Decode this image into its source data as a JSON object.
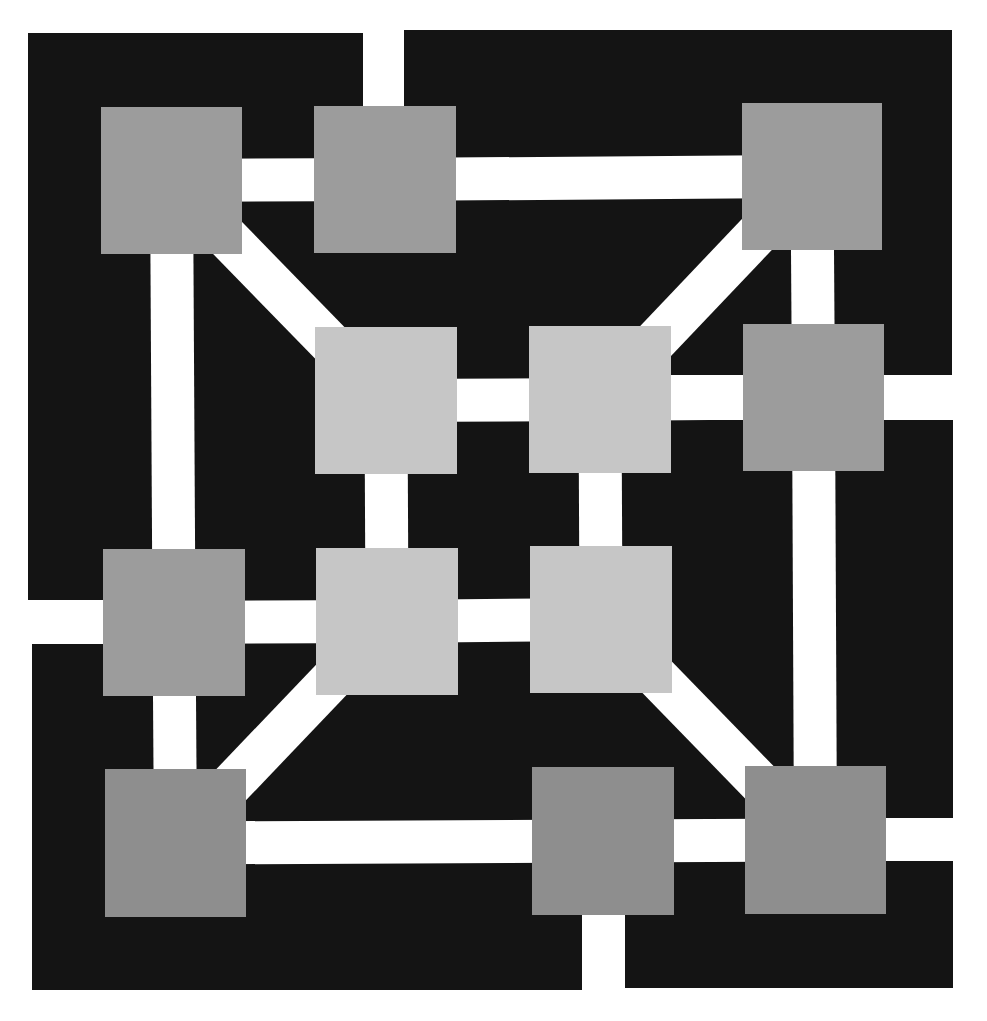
{
  "diagram": {
    "type": "graph",
    "colors": {
      "background": "#ffffff",
      "field": "#141414",
      "edge": "#ffffff",
      "node_outer": "#9c9c9c",
      "node_inner": "#c6c6c6",
      "node_bottom": "#8e8e8e"
    },
    "field_blocks": [
      {
        "x": 28,
        "y": 33,
        "w": 335,
        "h": 589
      },
      {
        "x": 404,
        "y": 30,
        "w": 548,
        "h": 345
      },
      {
        "x": 32,
        "y": 645,
        "w": 550,
        "h": 345
      },
      {
        "x": 625,
        "y": 420,
        "w": 328,
        "h": 568
      },
      {
        "x": 363,
        "y": 100,
        "w": 41,
        "h": 275
      },
      {
        "x": 363,
        "y": 375,
        "w": 262,
        "h": 270
      },
      {
        "x": 32,
        "y": 622,
        "w": 593,
        "h": 23
      },
      {
        "x": 582,
        "y": 645,
        "w": 43,
        "h": 210
      }
    ],
    "nodes": [
      {
        "id": "n1",
        "x": 101,
        "y": 107,
        "w": 141,
        "h": 147,
        "tone": "node_outer"
      },
      {
        "id": "n2",
        "x": 314,
        "y": 106,
        "w": 142,
        "h": 147,
        "tone": "node_outer"
      },
      {
        "id": "n3",
        "x": 742,
        "y": 103,
        "w": 140,
        "h": 147,
        "tone": "node_outer"
      },
      {
        "id": "n4",
        "x": 315,
        "y": 327,
        "w": 142,
        "h": 147,
        "tone": "node_inner"
      },
      {
        "id": "n5",
        "x": 529,
        "y": 326,
        "w": 142,
        "h": 147,
        "tone": "node_inner"
      },
      {
        "id": "n6",
        "x": 743,
        "y": 324,
        "w": 141,
        "h": 147,
        "tone": "node_outer"
      },
      {
        "id": "n7",
        "x": 103,
        "y": 549,
        "w": 142,
        "h": 147,
        "tone": "node_outer"
      },
      {
        "id": "n8",
        "x": 316,
        "y": 548,
        "w": 142,
        "h": 147,
        "tone": "node_inner"
      },
      {
        "id": "n9",
        "x": 530,
        "y": 546,
        "w": 142,
        "h": 147,
        "tone": "node_inner"
      },
      {
        "id": "n10",
        "x": 105,
        "y": 769,
        "w": 141,
        "h": 148,
        "tone": "node_bottom"
      },
      {
        "id": "n11",
        "x": 532,
        "y": 767,
        "w": 142,
        "h": 148,
        "tone": "node_bottom"
      },
      {
        "id": "n12",
        "x": 745,
        "y": 766,
        "w": 141,
        "h": 148,
        "tone": "node_bottom"
      }
    ],
    "edges": [
      {
        "from": "n1",
        "to": "n2",
        "kind": "horizontal"
      },
      {
        "from": "n2",
        "to": "n3",
        "kind": "horizontal"
      },
      {
        "from": "n1",
        "to": "n7",
        "kind": "vertical"
      },
      {
        "from": "n7",
        "to": "n10",
        "kind": "vertical"
      },
      {
        "from": "n1",
        "to": "n4",
        "kind": "diagonal"
      },
      {
        "from": "n3",
        "to": "n5",
        "kind": "diagonal"
      },
      {
        "from": "n3",
        "to": "n6",
        "kind": "vertical"
      },
      {
        "from": "n6",
        "to": "n12",
        "kind": "vertical"
      },
      {
        "from": "n4",
        "to": "n5",
        "kind": "horizontal"
      },
      {
        "from": "n5",
        "to": "n6",
        "kind": "horizontal"
      },
      {
        "from": "n4",
        "to": "n8",
        "kind": "vertical"
      },
      {
        "from": "n5",
        "to": "n9",
        "kind": "vertical"
      },
      {
        "from": "n7",
        "to": "n8",
        "kind": "horizontal"
      },
      {
        "from": "n8",
        "to": "n9",
        "kind": "horizontal"
      },
      {
        "from": "n8",
        "to": "n10",
        "kind": "diagonal"
      },
      {
        "from": "n9",
        "to": "n12",
        "kind": "diagonal"
      },
      {
        "from": "n10",
        "to": "n11",
        "kind": "horizontal"
      },
      {
        "from": "n11",
        "to": "n12",
        "kind": "horizontal"
      }
    ],
    "stubs": [
      {
        "x": 363,
        "y": 0,
        "w": 41,
        "h": 110,
        "label": "top-exit"
      },
      {
        "x": 0,
        "y": 600,
        "w": 110,
        "h": 44,
        "label": "left-exit"
      },
      {
        "x": 880,
        "y": 376,
        "w": 107,
        "h": 43,
        "label": "right-exit-upper"
      },
      {
        "x": 880,
        "y": 818,
        "w": 107,
        "h": 43,
        "label": "right-exit-lower"
      },
      {
        "x": 582,
        "y": 910,
        "w": 43,
        "h": 111,
        "label": "bottom-exit"
      }
    ],
    "edge_width": 43
  }
}
